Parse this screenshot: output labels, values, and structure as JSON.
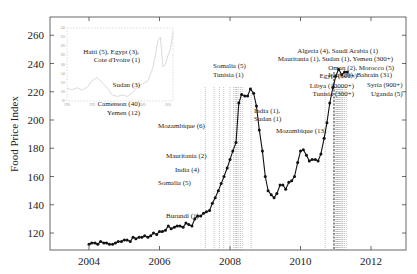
{
  "chart_data": {
    "type": "line",
    "title": "",
    "xlabel": "",
    "ylabel": "Food Price Index",
    "xlim": [
      2003.0,
      2013.0
    ],
    "ylim": [
      108,
      268
    ],
    "xticks": [
      2004,
      2006,
      2008,
      2010,
      2012
    ],
    "xtick_labels": [
      "2004",
      "2006",
      "2008",
      "2010",
      "2012"
    ],
    "yticks": [
      120,
      140,
      160,
      180,
      200,
      220,
      240,
      260
    ],
    "ytick_labels": [
      "120",
      "140",
      "160",
      "180",
      "200",
      "220",
      "240",
      "260"
    ],
    "grid": false,
    "series": [
      {
        "name": "FAO Food Price Index",
        "x": [
          2004.0,
          2004.08,
          2004.17,
          2004.25,
          2004.33,
          2004.42,
          2004.5,
          2004.58,
          2004.67,
          2004.75,
          2004.83,
          2004.92,
          2005.0,
          2005.08,
          2005.17,
          2005.25,
          2005.33,
          2005.42,
          2005.5,
          2005.58,
          2005.67,
          2005.75,
          2005.83,
          2005.92,
          2006.0,
          2006.08,
          2006.17,
          2006.25,
          2006.33,
          2006.42,
          2006.5,
          2006.58,
          2006.67,
          2006.75,
          2006.83,
          2006.92,
          2007.0,
          2007.08,
          2007.17,
          2007.25,
          2007.33,
          2007.42,
          2007.5,
          2007.58,
          2007.67,
          2007.75,
          2007.83,
          2007.92,
          2008.0,
          2008.08,
          2008.17,
          2008.25,
          2008.33,
          2008.42,
          2008.5,
          2008.58,
          2008.67,
          2008.75,
          2008.83,
          2008.92,
          2009.0,
          2009.08,
          2009.17,
          2009.25,
          2009.33,
          2009.42,
          2009.5,
          2009.58,
          2009.67,
          2009.75,
          2009.83,
          2009.92,
          2010.0,
          2010.08,
          2010.17,
          2010.25,
          2010.33,
          2010.42,
          2010.5,
          2010.58,
          2010.67,
          2010.75,
          2010.83,
          2010.92,
          2011.0,
          2011.08,
          2011.17,
          2011.25,
          2011.33
        ],
        "values": [
          112,
          113,
          113,
          112,
          114,
          113,
          113,
          112,
          112,
          113,
          114,
          114,
          115,
          115,
          114,
          117,
          116,
          117,
          117,
          118,
          117,
          118,
          120,
          119,
          121,
          121,
          122,
          125,
          123,
          124,
          125,
          125,
          124,
          127,
          126,
          125,
          130,
          132,
          132,
          134,
          135,
          136,
          141,
          145,
          150,
          155,
          160,
          166,
          172,
          178,
          184,
          212,
          218,
          217,
          217,
          222,
          219,
          210,
          193,
          178,
          160,
          150,
          147,
          145,
          148,
          154,
          154,
          151,
          156,
          157,
          160,
          170,
          178,
          179,
          175,
          171,
          172,
          172,
          171,
          176,
          187,
          198,
          212,
          223,
          231,
          236,
          232,
          234,
          234
        ]
      }
    ],
    "annotations": [
      {
        "text": "Burundi (1)",
        "x": 2005.2
      },
      {
        "text": "Somalia (5)",
        "x": 2007.55
      },
      {
        "text": "India (4)",
        "x": 2007.7
      },
      {
        "text": "Mauritania (2)",
        "x": 2007.8
      },
      {
        "text": "Mozambique (6)",
        "x": 2008.0
      },
      {
        "text": "Cameroon (40)",
        "x": 2008.15
      },
      {
        "text": "Yemen (12)",
        "x": 2008.2
      },
      {
        "text": "Sudan (3)",
        "x": 2008.18
      },
      {
        "text": "Haiti (5), Egypt (3),",
        "x": 2008.25
      },
      {
        "text": "Cote d'Ivoire (1)",
        "x": 2008.25
      },
      {
        "text": "Somalia (5)",
        "x": 2008.3
      },
      {
        "text": "Tunisia (1)",
        "x": 2008.35
      },
      {
        "text": "India (1),",
        "x": 2008.6
      },
      {
        "text": "Sudan (1)",
        "x": 2008.6
      },
      {
        "text": "Mozambique (13)",
        "x": 2010.7
      },
      {
        "text": "Tunisia (300+)",
        "x": 2010.95
      },
      {
        "text": "Libya (10000+)",
        "x": 2011.05
      },
      {
        "text": "Egypt (800+)",
        "x": 2011.08
      },
      {
        "text": "Iraq (29), Bahrain (31)",
        "x": 2011.12
      },
      {
        "text": "Oman (2), Morocco (5)",
        "x": 2011.15
      },
      {
        "text": "Syria (900+)",
        "x": 2011.2
      },
      {
        "text": "Uganda (5)",
        "x": 2011.3
      },
      {
        "text": "Mauritania (1), Sudan (1), Yemen (300+)",
        "x": 2011.05
      },
      {
        "text": "Algeria (4), Saudi Arabia (1)",
        "x": 2011.02
      }
    ],
    "event_lines_x": [
      2007.3,
      2007.55,
      2007.7,
      2007.82,
      2008.0,
      2008.1,
      2008.15,
      2008.18,
      2008.2,
      2008.25,
      2008.3,
      2008.35,
      2008.6,
      2010.7,
      2010.95,
      2011.0,
      2011.02,
      2011.05,
      2011.07,
      2011.1,
      2011.12,
      2011.15,
      2011.18,
      2011.2,
      2011.25,
      2011.3
    ],
    "inset": {
      "type": "line",
      "xlim": [
        1990,
        2011
      ],
      "ylim": [
        80,
        240
      ],
      "xtick_labels": [
        "1990",
        "1995",
        "2000",
        "2005",
        "2010"
      ],
      "ytick_labels": [
        "80",
        "100",
        "120",
        "140",
        "160",
        "180",
        "200",
        "220",
        "240"
      ],
      "x": [
        1990,
        1991,
        1992,
        1993,
        1994,
        1995,
        1996,
        1997,
        1998,
        1999,
        2000,
        2001,
        2002,
        2003,
        2004,
        2005,
        2006,
        2007,
        2008,
        2008.5,
        2009,
        2009.5,
        2010,
        2010.5,
        2011
      ],
      "values": [
        107,
        105,
        109,
        104,
        110,
        125,
        131,
        120,
        108,
        93,
        90,
        93,
        90,
        98,
        112,
        118,
        124,
        152,
        212,
        220,
        155,
        160,
        180,
        195,
        232
      ]
    }
  }
}
